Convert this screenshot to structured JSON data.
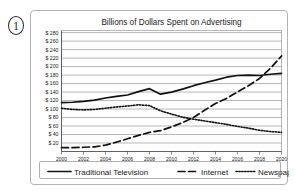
{
  "question_number": "1",
  "chart_data": {
    "type": "line",
    "title": "Billions of Dollars Spent on Advertising",
    "xlabel": "",
    "ylabel": "",
    "x": [
      2000,
      2001,
      2002,
      2003,
      2004,
      2005,
      2006,
      2007,
      2008,
      2009,
      2010,
      2011,
      2012,
      2013,
      2014,
      2015,
      2016,
      2017,
      2018,
      2019,
      2020
    ],
    "xlim": [
      2000,
      2020
    ],
    "ylim": [
      0,
      285
    ],
    "grid": true,
    "x_tick_labels": [
      "2000",
      "2002",
      "2004",
      "2006",
      "2008",
      "2010",
      "2012",
      "2014",
      "2016",
      "2018",
      "2020"
    ],
    "x_ticks": [
      2000,
      2002,
      2004,
      2006,
      2008,
      2010,
      2012,
      2014,
      2016,
      2018,
      2020
    ],
    "y_ticks": [
      20,
      40,
      60,
      80,
      100,
      120,
      140,
      160,
      180,
      200,
      220,
      240,
      260,
      280
    ],
    "y_tick_labels": [
      "$ 20",
      "$ 40",
      "$ 60",
      "$ 80",
      "$ 100",
      "$ 120",
      "$ 140",
      "$ 160",
      "$ 180",
      "$ 200",
      "$ 220",
      "$ 240",
      "$ 260",
      "$ 280"
    ],
    "legend_position": "bottom",
    "series": [
      {
        "name": "Traditional Television",
        "style": "solid",
        "color": "#111111",
        "values": [
          115,
          116,
          118,
          121,
          126,
          130,
          133,
          141,
          148,
          135,
          140,
          147,
          155,
          162,
          168,
          175,
          179,
          180,
          179,
          182,
          184
        ]
      },
      {
        "name": "Internet",
        "style": "dashed",
        "color": "#111111",
        "values": [
          9,
          9,
          10,
          11,
          15,
          22,
          30,
          38,
          45,
          49,
          58,
          68,
          80,
          97,
          113,
          125,
          140,
          155,
          172,
          196,
          225
        ]
      },
      {
        "name": "Newspaper",
        "style": "dotted",
        "color": "#111111",
        "values": [
          102,
          99,
          98,
          99,
          102,
          105,
          107,
          110,
          108,
          96,
          88,
          81,
          76,
          72,
          68,
          64,
          59,
          55,
          50,
          47,
          45
        ]
      }
    ]
  },
  "legend": {
    "items": [
      {
        "label": "Traditional Television",
        "style": "solid"
      },
      {
        "label": "Internet",
        "style": "dashed"
      },
      {
        "label": "Newspaper",
        "style": "dotted"
      }
    ]
  }
}
